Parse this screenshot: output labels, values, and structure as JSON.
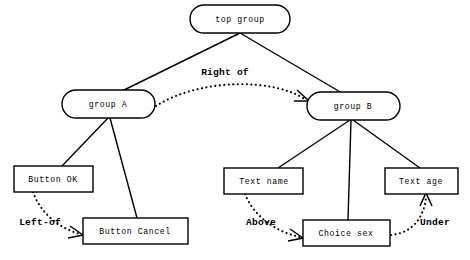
{
  "diagram": {
    "type": "tree-with-relations",
    "background_color": "#ffffff",
    "line_color": "#000000",
    "width": 470,
    "height": 260,
    "nodes": [
      {
        "id": "top-group",
        "label": "top group",
        "shape": "rounded-ellipse",
        "cx": 240,
        "cy": 19,
        "w": 100,
        "h": 28,
        "level": 0
      },
      {
        "id": "group-a",
        "label": "group A",
        "shape": "rounded-ellipse",
        "cx": 108,
        "cy": 104,
        "w": 93,
        "h": 28,
        "level": 1
      },
      {
        "id": "group-b",
        "label": "group B",
        "shape": "rounded-ellipse",
        "cx": 353,
        "cy": 106,
        "w": 93,
        "h": 28,
        "level": 1
      },
      {
        "id": "button-ok",
        "label": "Button OK",
        "shape": "rectangle",
        "cx": 53,
        "cy": 179,
        "w": 79,
        "h": 26,
        "level": 2
      },
      {
        "id": "button-cancel",
        "label": "Button Cancel",
        "shape": "rectangle",
        "cx": 135,
        "cy": 231,
        "w": 105,
        "h": 26,
        "level": 2
      },
      {
        "id": "text-name",
        "label": "Text name",
        "shape": "rectangle",
        "cx": 264,
        "cy": 181,
        "w": 79,
        "h": 26,
        "level": 2
      },
      {
        "id": "text-age",
        "label": "Text age",
        "shape": "rectangle",
        "cx": 421,
        "cy": 181,
        "w": 73,
        "h": 26,
        "level": 2
      },
      {
        "id": "choice-sex",
        "label": "Choice sex",
        "shape": "rectangle",
        "cx": 346,
        "cy": 233,
        "w": 87,
        "h": 26,
        "level": 2
      }
    ],
    "tree_edges": [
      {
        "from": "top-group",
        "to": "group-a",
        "style": "solid"
      },
      {
        "from": "top-group",
        "to": "group-b",
        "style": "solid"
      },
      {
        "from": "group-a",
        "to": "button-ok",
        "style": "solid"
      },
      {
        "from": "group-a",
        "to": "button-cancel",
        "style": "solid"
      },
      {
        "from": "group-b",
        "to": "text-name",
        "style": "solid"
      },
      {
        "from": "group-b",
        "to": "choice-sex",
        "style": "solid"
      },
      {
        "from": "group-b",
        "to": "text-age",
        "style": "solid"
      }
    ],
    "relation_edges": [
      {
        "id": "right-of",
        "label": "Right of",
        "from": "group-a",
        "to": "group-b",
        "style": "dotted",
        "arrow": true,
        "label_x": 225,
        "label_y": 72
      },
      {
        "id": "left-of",
        "label": "Left-of",
        "from": "button-ok",
        "to": "button-cancel",
        "style": "dotted",
        "arrow": true,
        "label_x": 40,
        "label_y": 222
      },
      {
        "id": "above",
        "label": "Above",
        "from": "text-name",
        "to": "choice-sex",
        "style": "dotted",
        "arrow": true,
        "label_x": 261,
        "label_y": 222
      },
      {
        "id": "under",
        "label": "Under",
        "from": "choice-sex",
        "to": "text-age",
        "style": "dotted",
        "arrow": true,
        "label_x": 435,
        "label_y": 222
      }
    ]
  }
}
